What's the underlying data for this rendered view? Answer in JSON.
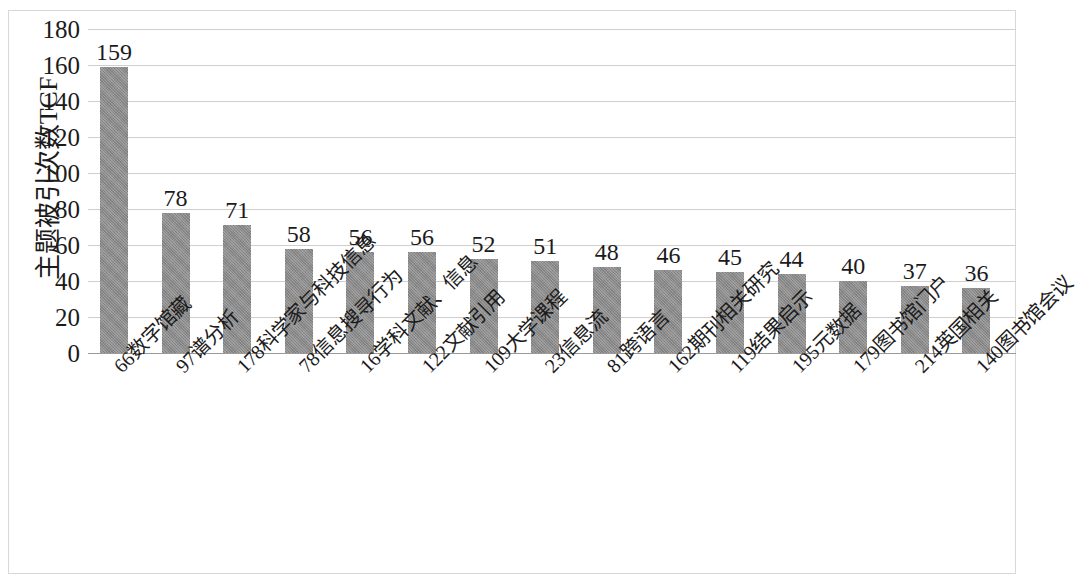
{
  "chart_data": {
    "type": "bar",
    "title": "",
    "xlabel": "",
    "ylabel": "主题被引次数TCF",
    "ylim": [
      0,
      180
    ],
    "ytick_step": 20,
    "yticks": [
      180,
      160,
      140,
      120,
      100,
      80,
      60,
      40,
      20,
      0
    ],
    "grid": true,
    "legend": "none",
    "bar_color": "#8a8a8a",
    "categories": [
      "66数字馆藏",
      "97谱分析",
      "178科学家与科技信息",
      "78信息搜寻行为",
      "16学科文献、信息",
      "122文献引用",
      "109大学课程",
      "23信息流",
      "81跨语言",
      "162期刊相关研究",
      "119结果启示",
      "195元数据",
      "179图书馆门户",
      "214英国相关",
      "140图书馆会议"
    ],
    "values": [
      159,
      78,
      71,
      58,
      56,
      56,
      52,
      51,
      48,
      46,
      45,
      44,
      40,
      37,
      36
    ],
    "value_labels": [
      "159",
      "78",
      "71",
      "58",
      "56",
      "56",
      "52",
      "51",
      "48",
      "46",
      "45",
      "44",
      "40",
      "37",
      "36"
    ]
  }
}
